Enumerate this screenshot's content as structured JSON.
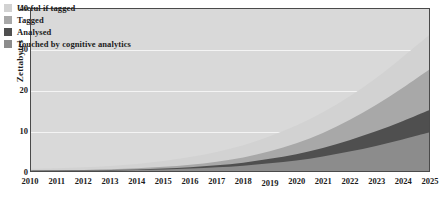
{
  "chart_data": {
    "type": "area",
    "title": "",
    "subtitle": "",
    "xlabel": "",
    "ylabel": "Zettabytes",
    "stacked": true,
    "grid": true,
    "legend_position": "top-left",
    "xlim": [
      2010,
      2025
    ],
    "ylim": [
      0,
      40
    ],
    "yticks": [
      0,
      10,
      20,
      30,
      40
    ],
    "ytick_labels": [
      "0",
      "10",
      "20",
      "30",
      "40"
    ],
    "categories": [
      2010,
      2011,
      2012,
      2013,
      2014,
      2015,
      2016,
      2017,
      2018,
      2019,
      2020,
      2021,
      2022,
      2023,
      2024,
      2025
    ],
    "xtick_labels": [
      "2010",
      "2011",
      "2012",
      "2013",
      "2014",
      "2015",
      "2016",
      "2017",
      "2018",
      "2019",
      "2020",
      "2021",
      "2022",
      "2023",
      "2024",
      "2025"
    ],
    "series": [
      {
        "name": "Touched by cognitive analytics",
        "color": "#8c8c8c",
        "stack_order": 1,
        "values": [
          0.05,
          0.07,
          0.1,
          0.15,
          0.25,
          0.4,
          0.6,
          0.9,
          1.3,
          1.9,
          2.6,
          3.6,
          4.8,
          6.2,
          7.8,
          9.5
        ]
      },
      {
        "name": "Analysed",
        "color": "#4f4f4f",
        "stack_order": 2,
        "values": [
          0.03,
          0.04,
          0.06,
          0.09,
          0.14,
          0.22,
          0.34,
          0.5,
          0.75,
          1.1,
          1.55,
          2.1,
          2.8,
          3.6,
          4.5,
          5.5
        ]
      },
      {
        "name": "Tagged",
        "color": "#a8a8a8",
        "stack_order": 3,
        "values": [
          0.05,
          0.07,
          0.11,
          0.17,
          0.26,
          0.4,
          0.6,
          0.9,
          1.3,
          1.9,
          2.7,
          3.7,
          5.0,
          6.5,
          8.2,
          10.0
        ]
      },
      {
        "name": "Useful if tagged",
        "color": "#d2d2d2",
        "stack_order": 4,
        "values": [
          0.4,
          0.5,
          0.65,
          0.85,
          1.1,
          1.45,
          1.9,
          2.4,
          3.0,
          3.7,
          4.4,
          5.1,
          5.8,
          6.6,
          7.6,
          8.5
        ]
      }
    ],
    "totals": [
      0.53,
      0.68,
      0.92,
      1.26,
      1.75,
      2.47,
      3.44,
      4.7,
      6.35,
      8.6,
      11.25,
      14.5,
      18.4,
      22.9,
      28.1,
      33.5
    ]
  },
  "legend": {
    "items": [
      {
        "label": "Useful if tagged",
        "color": "#d2d2d2"
      },
      {
        "label": "Tagged",
        "color": "#a8a8a8"
      },
      {
        "label": "Analysed",
        "color": "#4f4f4f"
      },
      {
        "label": "Touched by cognitive analytics",
        "color": "#8c8c8c"
      }
    ]
  },
  "style": {
    "plot_background": "#d9d9d9",
    "gridline_color": "#f4f4f4",
    "axis_color": "#4a4a4a",
    "text_color": "#1c1c1c",
    "page_background": "#ffffff"
  }
}
